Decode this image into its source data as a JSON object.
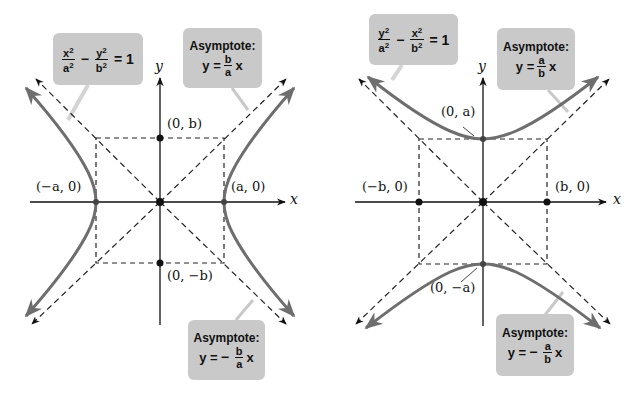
{
  "left": {
    "equation": {
      "num1": "x",
      "den1": "a",
      "minus": "−",
      "num2": "y",
      "den2": "b",
      "rhs": "= 1",
      "exp": "2"
    },
    "asymptote_pos": {
      "title": "Asymptote:",
      "lhs": "y =",
      "num": "b",
      "den": "a",
      "var": "x"
    },
    "asymptote_neg": {
      "title": "Asymptote:",
      "lhs": "y =",
      "sign": "−",
      "num": "b",
      "den": "a",
      "var": "x"
    },
    "axis_x": "x",
    "axis_y": "y",
    "points": {
      "vertex_left": "(−a, 0)",
      "vertex_right": "(a, 0)",
      "co_vertex_top": "(0, b)",
      "co_vertex_bottom": "(0, −b)"
    }
  },
  "right": {
    "equation": {
      "num1": "y",
      "den1": "a",
      "minus": "−",
      "num2": "x",
      "den2": "b",
      "rhs": "= 1",
      "exp": "2"
    },
    "asymptote_pos": {
      "title": "Asymptote:",
      "lhs": "y =",
      "num": "a",
      "den": "b",
      "var": "x"
    },
    "asymptote_neg": {
      "title": "Asymptote:",
      "lhs": "y =",
      "sign": "−",
      "num": "a",
      "den": "b",
      "var": "x"
    },
    "axis_x": "x",
    "axis_y": "y",
    "points": {
      "co_vertex_left": "(−b, 0)",
      "co_vertex_right": "(b, 0)",
      "vertex_top": "(0, a)",
      "vertex_bottom": "(0, −a)"
    }
  },
  "colors": {
    "curve": "#6e6e6e",
    "callout_bg": "#c9c9c9",
    "axis": "#111111",
    "dashed": "#222222"
  }
}
